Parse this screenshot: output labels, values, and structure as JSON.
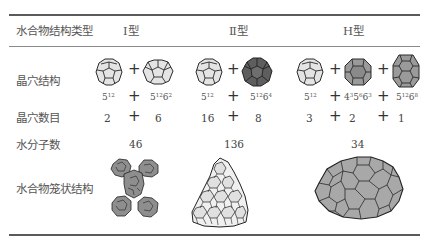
{
  "table": {
    "header": {
      "row_label": "水合物结构类型",
      "columns": [
        "Ⅰ型",
        "Ⅱ型",
        "H型"
      ]
    },
    "rows": {
      "cavity_structure": {
        "label": "晶穴结构",
        "type_I": {
          "cavities": [
            "5^12",
            "5^12 6^2"
          ],
          "operator": "+"
        },
        "type_II": {
          "cavities": [
            "5^12",
            "5^12 6^4"
          ],
          "operator": "+"
        },
        "type_H": {
          "cavities": [
            "5^12",
            "4^3 5^6 6^3",
            "5^12 6^8"
          ],
          "operator": "+"
        }
      },
      "cavity_count": {
        "label": "晶穴数目",
        "type_I": [
          "2",
          "6"
        ],
        "type_II": [
          "16",
          "8"
        ],
        "type_H": [
          "3",
          "2",
          "1"
        ]
      },
      "water_molecules": {
        "label": "水分子数",
        "type_I": "46",
        "type_II": "136",
        "type_H": "34"
      },
      "cage_structure": {
        "label": "水合物笼状结构",
        "type_I": "x-shaped cluster of polyhedral cages",
        "type_II": "triangular cluster of light cages",
        "type_H": "oval cluster of gray cages"
      }
    },
    "formulas": {
      "f512": {
        "base": "5",
        "exp": "12"
      },
      "f51262": {
        "a": "5",
        "ae": "12",
        "b": "6",
        "be": "2"
      },
      "f51264": {
        "a": "5",
        "ae": "12",
        "b": "6",
        "be": "4"
      },
      "f435663": {
        "a": "4",
        "ae": "3",
        "b": "5",
        "be": "6",
        "c": "6",
        "ce": "3"
      },
      "f51268": {
        "a": "5",
        "ae": "12",
        "b": "6",
        "be": "8"
      }
    },
    "plus": "+",
    "colors": {
      "light_cage": "#e6e6e6",
      "dark_cage": "#5e5e5e",
      "mid_cage": "#9a9a9a",
      "cluster_gray": "#a8a8a8",
      "cluster_light": "#efefef",
      "stroke": "#2a2a2a"
    }
  }
}
